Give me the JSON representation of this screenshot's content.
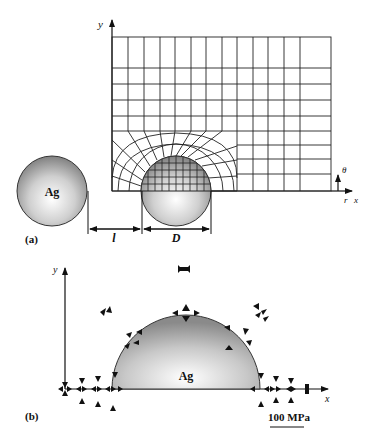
{
  "figure": {
    "panel_a": {
      "label": "(a)",
      "axis_y": "y",
      "axis_r": "r",
      "axis_x": "x",
      "axis_theta": "θ",
      "particle_label": "Ag",
      "dim_gap": "l",
      "dim_diameter": "D"
    },
    "panel_b": {
      "label": "(b)",
      "axis_y": "y",
      "axis_x": "x",
      "particle_label": "Ag",
      "scale_bar": "100 MPa"
    }
  },
  "colors": {
    "line": "#1a1a1a",
    "sphere_edge": "#3a3a3a",
    "sphere_light": "#ffffff",
    "sphere_dark": "#8a8a8a"
  }
}
